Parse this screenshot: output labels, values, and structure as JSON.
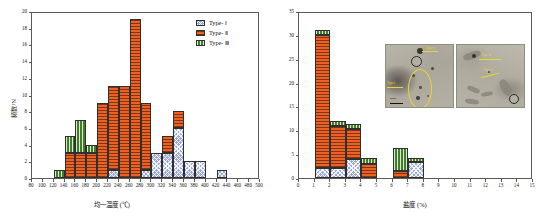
{
  "figure": {
    "panels": [
      "homogenization-temperature-histogram",
      "salinity-histogram"
    ]
  },
  "legend": {
    "items": [
      {
        "label": "Type- Ⅰ",
        "color": "#9aa7d8",
        "key": "type1"
      },
      {
        "label": "Type- Ⅱ",
        "color": "#ef6023",
        "key": "type2"
      },
      {
        "label": "Type- Ⅲ",
        "color": "#3f7d2a",
        "key": "type3"
      }
    ]
  },
  "chart_data": [
    {
      "type": "bar",
      "id": "homogenization-temperature",
      "stacked": true,
      "title": "",
      "xlabel": "均一温度 (℃)",
      "ylabel": "频数/N",
      "xlim": [
        80,
        500
      ],
      "ylim": [
        0,
        20
      ],
      "ytick_step": 2,
      "xtick_step": 20,
      "grid": false,
      "legend_position": "top-right",
      "categories": [
        "120-140",
        "140-160",
        "160-180",
        "180-200",
        "200-220",
        "220-240",
        "240-260",
        "260-280",
        "280-300",
        "300-320",
        "320-340",
        "340-360",
        "360-380",
        "380-400",
        "400-420",
        "420-440"
      ],
      "bin_starts": [
        120,
        140,
        160,
        180,
        200,
        220,
        240,
        260,
        280,
        300,
        320,
        340,
        360,
        380,
        400,
        420
      ],
      "bin_width": 20,
      "series": [
        {
          "name": "Type- Ⅰ",
          "values": [
            0,
            0,
            0,
            0,
            0,
            1,
            0,
            0,
            1,
            3,
            3,
            6,
            2,
            2,
            0,
            1
          ]
        },
        {
          "name": "Type- Ⅱ",
          "values": [
            0,
            3,
            3,
            3,
            9,
            10,
            11,
            19,
            8,
            0,
            2,
            2,
            0,
            0,
            0,
            0
          ]
        },
        {
          "name": "Type- Ⅲ",
          "values": [
            1,
            2,
            4,
            1,
            0,
            0,
            0,
            0,
            0,
            0,
            0,
            0,
            0,
            0,
            0,
            0
          ]
        }
      ],
      "totals": [
        1,
        5,
        7,
        4,
        9,
        11,
        11,
        19,
        9,
        3,
        5,
        8,
        2,
        2,
        0,
        1
      ]
    },
    {
      "type": "bar",
      "id": "salinity",
      "stacked": true,
      "title": "",
      "xlabel": "盐度 (%)",
      "ylabel": "",
      "xlim": [
        0,
        15
      ],
      "ylim": [
        0,
        35
      ],
      "ytick_step": 5,
      "xtick_step": 1,
      "grid": false,
      "categories": [
        "1-2",
        "2-3",
        "3-4",
        "4-5",
        "6-7",
        "7-8"
      ],
      "bin_starts": [
        1,
        2,
        3,
        4,
        6,
        7
      ],
      "bin_width": 1,
      "series": [
        {
          "name": "Type- Ⅰ",
          "values": [
            2,
            2,
            4,
            0,
            0,
            3.4
          ]
        },
        {
          "name": "Type- Ⅱ",
          "values": [
            28,
            9,
            6.2,
            3,
            1.4,
            0
          ]
        },
        {
          "name": "Type- Ⅲ",
          "values": [
            1,
            1,
            1.2,
            1.2,
            4.8,
            0.9
          ]
        }
      ],
      "totals": [
        31,
        12,
        11.4,
        4.2,
        6.2,
        4.3
      ]
    }
  ],
  "left_axis": {
    "xticks": [
      "80",
      "100",
      "120",
      "140",
      "160",
      "180",
      "200",
      "220",
      "240",
      "260",
      "280",
      "300",
      "320",
      "340",
      "360",
      "380",
      "400",
      "420",
      "440",
      "460",
      "480",
      "500"
    ],
    "yticks": [
      "0",
      "2",
      "4",
      "6",
      "8",
      "10",
      "12",
      "14",
      "16",
      "18",
      "20"
    ],
    "xlabel": "均一温度 (℃)",
    "ylabel": "频数/N"
  },
  "right_axis": {
    "xticks": [
      "0",
      "1",
      "2",
      "3",
      "4",
      "5",
      "6",
      "7",
      "8",
      "9",
      "10",
      "11",
      "12",
      "13",
      "14",
      "15"
    ],
    "yticks": [
      "0",
      "5",
      "10",
      "15",
      "20",
      "25",
      "30",
      "35"
    ],
    "xlabel": "盐度 (%)",
    "ylabel": ""
  },
  "inset": {
    "name": "fluid-inclusion-photomicrographs",
    "photos": [
      {
        "id": "photo-left",
        "scalebar_label": "20μm",
        "annotations": [
          "Type-Ⅱ",
          "Type-Ⅰ"
        ]
      },
      {
        "id": "photo-right",
        "scalebar_label": "",
        "annotations": [
          "Type-Ⅲ",
          "Type-Ⅱ"
        ]
      }
    ]
  },
  "colors": {
    "type1": "#9aa7d8",
    "type2": "#ef6023",
    "type3": "#3f7d2a",
    "axis": "#5a5a52",
    "annotation": "#e8d53a"
  }
}
